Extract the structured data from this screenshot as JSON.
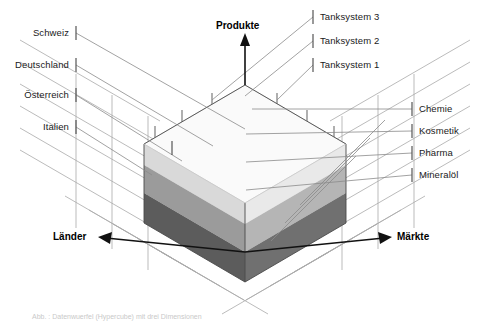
{
  "diagram": {
    "axes": {
      "vertical": {
        "label": "Produkte",
        "arrow": "up-arrow-icon"
      },
      "left": {
        "label": "Länder",
        "arrow": "down-left-arrow-icon"
      },
      "right": {
        "label": "Märkte",
        "arrow": "down-right-arrow-icon"
      }
    },
    "dimensions": {
      "laender": {
        "axis_label": "Länder",
        "members": [
          "Schweiz",
          "Deutschland",
          "Österreich",
          "Italien"
        ]
      },
      "produkte": {
        "axis_label": "Produkte",
        "members": [
          "Tanksystem 3",
          "Tanksystem 2",
          "Tanksystem 1"
        ]
      },
      "maerkte": {
        "axis_label": "Märkte",
        "members": [
          "Chemie",
          "Kosmetik",
          "Pharma",
          "Mineralöl"
        ]
      }
    },
    "cube": {
      "layers": [
        {
          "name": "top-layer",
          "color": "#f2f2f2"
        },
        {
          "name": "middle-layer",
          "color": "#c8c8c8"
        },
        {
          "name": "bottom-layer",
          "color": "#787878"
        }
      ],
      "face_colors": {
        "top_surface": "#fafafa",
        "left_light": "#d8d8d8",
        "left_mid": "#9a9a9a",
        "left_dark": "#5a5a5a",
        "right_light": "#e8e8e8",
        "right_mid": "#b4b4b4",
        "right_dark": "#6e6e6e"
      },
      "grid_color": "#a8a8a8",
      "edge_color": "#555555"
    },
    "caption": "Abb. : Datenwuerfel (Hypercube) mit drei Dimensionen"
  }
}
